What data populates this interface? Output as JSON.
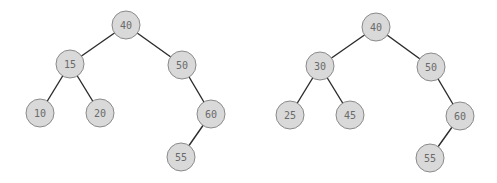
{
  "diagram": {
    "type": "binary-search-trees",
    "node_radius": 14,
    "colors": {
      "node_fill": "#d9d9d9",
      "node_stroke": "#8a8a8a",
      "edge": "#2b2b2b",
      "label": "#6a6a6a",
      "background": "#ffffff"
    },
    "trees": [
      {
        "name": "tree-left",
        "nodes": [
          {
            "id": "L40",
            "label": "40",
            "x": 126,
            "y": 25
          },
          {
            "id": "L15",
            "label": "15",
            "x": 70,
            "y": 64
          },
          {
            "id": "L50",
            "label": "50",
            "x": 182,
            "y": 65
          },
          {
            "id": "L10",
            "label": "10",
            "x": 40,
            "y": 113
          },
          {
            "id": "L20",
            "label": "20",
            "x": 100,
            "y": 113
          },
          {
            "id": "L60",
            "label": "60",
            "x": 211,
            "y": 114
          },
          {
            "id": "L55",
            "label": "55",
            "x": 181,
            "y": 157
          }
        ],
        "edges": [
          [
            "L40",
            "L15"
          ],
          [
            "L40",
            "L50"
          ],
          [
            "L15",
            "L10"
          ],
          [
            "L15",
            "L20"
          ],
          [
            "L50",
            "L60"
          ],
          [
            "L60",
            "L55"
          ]
        ]
      },
      {
        "name": "tree-right",
        "nodes": [
          {
            "id": "R40",
            "label": "40",
            "x": 376,
            "y": 27
          },
          {
            "id": "R30",
            "label": "30",
            "x": 320,
            "y": 66
          },
          {
            "id": "R50",
            "label": "50",
            "x": 431,
            "y": 67
          },
          {
            "id": "R25",
            "label": "25",
            "x": 290,
            "y": 115
          },
          {
            "id": "R45",
            "label": "45",
            "x": 350,
            "y": 115
          },
          {
            "id": "R60",
            "label": "60",
            "x": 460,
            "y": 116
          },
          {
            "id": "R55",
            "label": "55",
            "x": 430,
            "y": 158
          }
        ],
        "edges": [
          [
            "R40",
            "R30"
          ],
          [
            "R40",
            "R50"
          ],
          [
            "R30",
            "R25"
          ],
          [
            "R30",
            "R45"
          ],
          [
            "R50",
            "R60"
          ],
          [
            "R60",
            "R55"
          ]
        ]
      }
    ]
  }
}
